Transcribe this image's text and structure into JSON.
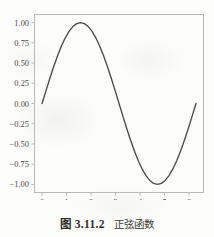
{
  "figure": {
    "caption_number": "图 3.11.2",
    "caption_title": "正弦函数",
    "frame_color": "#b9b9b5",
    "curve_color": "#4b4b4e",
    "background_color": "#fcfcfb",
    "tick_text_color": "#4a4a48"
  },
  "chart_data": {
    "type": "line",
    "xlabel": "",
    "ylabel": "",
    "grid": false,
    "legend": null,
    "xlim": [
      -0.31,
      6.59
    ],
    "ylim": [
      -1.1,
      1.1
    ],
    "xticks": [
      0,
      1,
      2,
      3,
      4,
      5,
      6
    ],
    "xtick_labels": [
      "0",
      "1",
      "2",
      "3",
      "4",
      "5",
      "6"
    ],
    "yticks": [
      1.0,
      0.75,
      0.5,
      0.25,
      0.0,
      -0.25,
      -0.5,
      -0.75,
      -1.0
    ],
    "ytick_labels": [
      "1.00",
      "0.75",
      "0.50",
      "0.25",
      "0.00",
      "−0.25",
      "−0.50",
      "−0.75",
      "−1.00"
    ],
    "series": [
      {
        "name": "sin(x)",
        "x": [
          0.0,
          0.1571,
          0.3142,
          0.4712,
          0.6283,
          0.7854,
          0.9425,
          1.0996,
          1.2566,
          1.4137,
          1.5708,
          1.7279,
          1.885,
          2.042,
          2.1991,
          2.3562,
          2.5133,
          2.6704,
          2.8274,
          2.9845,
          3.1416,
          3.2987,
          3.4558,
          3.6128,
          3.7699,
          3.927,
          4.0841,
          4.2412,
          4.3982,
          4.5553,
          4.7124,
          4.8695,
          5.0265,
          5.1836,
          5.3407,
          5.4978,
          5.6549,
          5.8119,
          5.969,
          6.1261,
          6.2832
        ],
        "y": [
          0.0,
          0.1564,
          0.309,
          0.454,
          0.5878,
          0.7071,
          0.809,
          0.891,
          0.9511,
          0.9877,
          1.0,
          0.9877,
          0.9511,
          0.891,
          0.809,
          0.7071,
          0.5878,
          0.454,
          0.309,
          0.1564,
          0.0,
          -0.1564,
          -0.309,
          -0.454,
          -0.5878,
          -0.7071,
          -0.809,
          -0.891,
          -0.9511,
          -0.9877,
          -1.0,
          -0.9877,
          -0.9511,
          -0.891,
          -0.809,
          -0.7071,
          -0.5878,
          -0.454,
          -0.309,
          -0.1564,
          0.0
        ]
      }
    ]
  }
}
